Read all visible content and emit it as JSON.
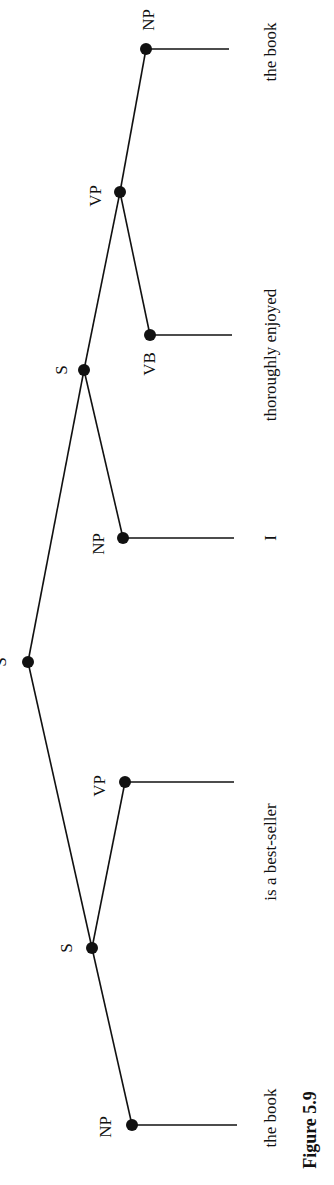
{
  "figure": {
    "caption": "Figure 5.9",
    "orientation": "rotated 90° counter-clockwise",
    "tree": {
      "root": {
        "id": "S0",
        "label": "S"
      },
      "nodes": [
        {
          "id": "S0",
          "label": "S",
          "x": 28,
          "y": 662,
          "parent": null
        },
        {
          "id": "S1",
          "label": "S",
          "x": 92,
          "y": 948,
          "parent": "S0"
        },
        {
          "id": "NP1",
          "label": "NP",
          "x": 132,
          "y": 1125,
          "parent": "S1",
          "leaf_end_x": 237
        },
        {
          "id": "VP1",
          "label": "VP",
          "x": 125,
          "y": 782,
          "parent": "S1",
          "leaf_end_x": 234
        },
        {
          "id": "S2",
          "label": "S",
          "x": 84,
          "y": 370,
          "parent": "S0"
        },
        {
          "id": "NP2",
          "label": "NP",
          "x": 123,
          "y": 538,
          "parent": "S2",
          "leaf_end_x": 234
        },
        {
          "id": "VP2",
          "label": "VP",
          "x": 120,
          "y": 192,
          "parent": "S2"
        },
        {
          "id": "VB",
          "label": "VB",
          "x": 150,
          "y": 335,
          "parent": "VP2",
          "leaf_end_x": 232
        },
        {
          "id": "NP3",
          "label": "NP",
          "x": 146,
          "y": 49,
          "parent": "VP2",
          "leaf_end_x": 229
        }
      ]
    },
    "labels": {
      "S0": "S",
      "S1": "S",
      "NP1": "NP",
      "VP1": "VP",
      "S2": "S",
      "NP2": "NP",
      "VP2": "VP",
      "VB": "VB",
      "NP3": "NP"
    },
    "words": {
      "w1": "the book",
      "w2": "is a best-seller",
      "w3": "I",
      "w4": "thoroughly enjoyed",
      "w5": "the book"
    }
  }
}
